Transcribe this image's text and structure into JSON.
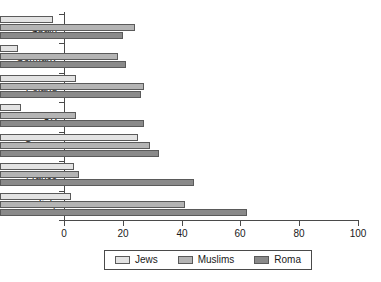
{
  "chart_data": {
    "type": "bar",
    "orientation": "horizontal",
    "title": "",
    "xlabel": "",
    "ylabel": "",
    "xlim": [
      0,
      100
    ],
    "xticks": [
      0,
      20,
      40,
      60,
      80,
      100
    ],
    "grid": false,
    "legend_position": "bottom",
    "categories": [
      "Spain",
      "Germany",
      "Poland",
      "UK",
      "Greece",
      "France",
      "Italy"
    ],
    "series": [
      {
        "name": "Jews",
        "color": "#e3e3e3",
        "values": [
          18,
          6,
          26,
          7,
          47,
          25,
          24
        ]
      },
      {
        "name": "Muslims",
        "color": "#b4b4b4",
        "values": [
          46,
          40,
          49,
          26,
          51,
          27,
          63
        ]
      },
      {
        "name": "Roma",
        "color": "#8a8a8a",
        "values": [
          42,
          43,
          48,
          49,
          54,
          66,
          84
        ]
      }
    ]
  },
  "legend": {
    "items": [
      {
        "label": "Jews"
      },
      {
        "label": "Muslims"
      },
      {
        "label": "Roma"
      }
    ]
  },
  "axis": {
    "x_tick_labels": [
      "0",
      "20",
      "40",
      "60",
      "80",
      "100"
    ]
  }
}
